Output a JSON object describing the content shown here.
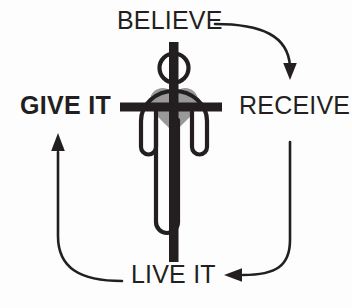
{
  "diagram": {
    "background_color": "#fdfdfd",
    "ink_color": "#231f20",
    "heart_color": "#999999",
    "labels": {
      "top": "BELIEVE",
      "right": "RECEIVE",
      "bottom": "LIVE IT",
      "left": "GIVE IT"
    },
    "label_styles": {
      "top": "regular",
      "right": "regular",
      "bottom": "regular",
      "left": "bold"
    },
    "icons": {
      "center": "person-with-cross-and-heart",
      "arrow_top_right": "curved-arrow-down",
      "arrow_bottom_right": "curved-arrow-left",
      "arrow_bottom_left": "curved-arrow-up"
    },
    "flow": [
      {
        "from": "BELIEVE",
        "to": "RECEIVE"
      },
      {
        "from": "RECEIVE",
        "to": "LIVE IT"
      },
      {
        "from": "LIVE IT",
        "to": "GIVE IT"
      }
    ]
  }
}
